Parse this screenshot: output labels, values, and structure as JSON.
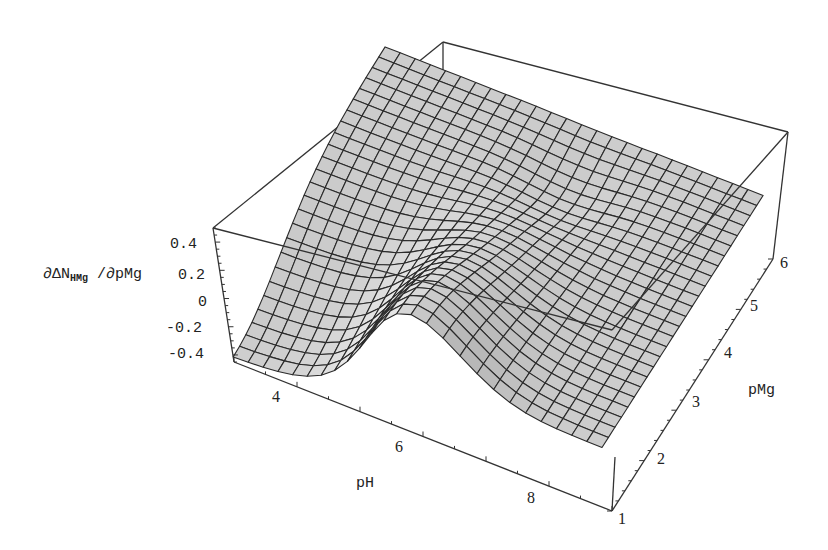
{
  "chart_data": {
    "type": "surface3d",
    "title": "",
    "xlabel": "pH",
    "ylabel": "pMg",
    "zlabel": "∂ΔN_HMg /∂pMg",
    "zlabel_parts": {
      "prefix": "∂ΔN",
      "subscript": "HMg",
      "suffix": " /∂pMg"
    },
    "x_range": [
      3,
      9
    ],
    "y_range": [
      1,
      6
    ],
    "z_range": [
      -0.45,
      0.5
    ],
    "x_ticks": [
      "4",
      "6",
      "8"
    ],
    "y_ticks": [
      "1",
      "2",
      "3",
      "4",
      "5",
      "6"
    ],
    "z_ticks": [
      "0.4",
      "0.2",
      "0",
      "-0.2",
      "-0.4"
    ],
    "grid_resolution": [
      25,
      25
    ],
    "shading": "gray mesh",
    "sample_points": [
      {
        "pH": 3.0,
        "pMg": 1,
        "value": -0.42
      },
      {
        "pH": 4.5,
        "pMg": 1,
        "value": -0.4
      },
      {
        "pH": 6.0,
        "pMg": 2,
        "value": 0.25
      },
      {
        "pH": 7.0,
        "pMg": 3,
        "value": 0.1
      },
      {
        "pH": 9.0,
        "pMg": 1,
        "value": 0.0
      },
      {
        "pH": 5.5,
        "pMg": 4.5,
        "value": 0.05
      },
      {
        "pH": 6.5,
        "pMg": 5,
        "value": -0.05
      },
      {
        "pH": 3.0,
        "pMg": 6,
        "value": 0.0
      }
    ]
  },
  "labels": {
    "z_axis_prefix": "∂ΔN",
    "z_axis_sub": "HMg",
    "z_axis_suffix": " /∂pMg",
    "x_axis": "pH",
    "y_axis": "pMg",
    "z_ticks": [
      {
        "text": "0.4",
        "x": 170,
        "y": 236
      },
      {
        "text": "0.2",
        "x": 178,
        "y": 267
      },
      {
        "text": "0",
        "x": 198,
        "y": 294
      },
      {
        "text": "-0.2",
        "x": 166,
        "y": 320
      },
      {
        "text": "-0.4",
        "x": 168,
        "y": 346
      }
    ],
    "x_ticks": [
      {
        "text": "4",
        "x": 272,
        "y": 388
      },
      {
        "text": "6",
        "x": 395,
        "y": 438
      },
      {
        "text": "8",
        "x": 527,
        "y": 489
      }
    ],
    "y_ticks": [
      {
        "text": "1",
        "x": 618,
        "y": 510
      },
      {
        "text": "2",
        "x": 657,
        "y": 450
      },
      {
        "text": "3",
        "x": 692,
        "y": 393
      },
      {
        "text": "4",
        "x": 724,
        "y": 344
      },
      {
        "text": "5",
        "x": 750,
        "y": 297
      },
      {
        "text": "6",
        "x": 780,
        "y": 254
      }
    ]
  },
  "colors": {
    "background": "#ffffff",
    "surface_light": "#e4e4e4",
    "surface_mid": "#c8c8c8",
    "surface_dark": "#6e6e6e",
    "mesh": "#2a2a2a",
    "box": "#333333"
  }
}
